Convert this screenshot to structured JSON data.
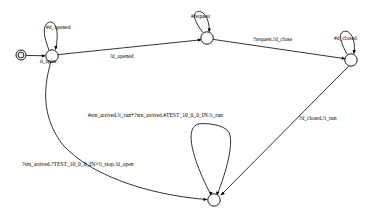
{
  "diagram": {
    "type": "state-machine",
    "title": "",
    "states": [
      {
        "id": "d_open",
        "label": "d_open",
        "cx": 52,
        "cy": 56,
        "r": 6.2,
        "initial": true
      },
      {
        "id": "s_req",
        "label": "",
        "cx": 207,
        "cy": 38,
        "r": 6.2,
        "initial": false
      },
      {
        "id": "d_closed",
        "label": "",
        "cx": 351,
        "cy": 60,
        "r": 6.2,
        "initial": false
      },
      {
        "id": "s_run",
        "label": "",
        "cx": 214,
        "cy": 200,
        "r": 6.2,
        "initial": false
      }
    ],
    "initial_marker": {
      "name": "initial-state-marker",
      "cx": 21,
      "cy": 55,
      "outer_r": 5.0,
      "inner_r": 3.0
    },
    "transitions": [
      {
        "id": "t-open-to-req",
        "from": "d_open",
        "to": "s_req",
        "label": "!d_opened",
        "label_x": 130,
        "label_y": 58
      },
      {
        "id": "t-req-to-closed",
        "from": "s_req",
        "to": "d_closed",
        "label": "?request.!d_close",
        "label_x": 258,
        "label_y": 41
      },
      {
        "id": "t-closed-to-run",
        "from": "d_closed",
        "to": "s_run",
        "label": "?d_closed.!t_run",
        "label_x": 302,
        "label_y": 119
      },
      {
        "id": "t-open-to-run",
        "from": "d_open",
        "to": "s_run",
        "label": "?stn_arrived.?TEST_10_0_0_IN>!t_stop.!d_open",
        "label_x": 22,
        "label_y": 166
      }
    ],
    "self_loops": [
      {
        "id": "loop-d-opened",
        "state": "d_open",
        "label": "#d_opened",
        "label_x": 46,
        "label_y": 29
      },
      {
        "id": "loop-request",
        "state": "s_req",
        "label": "#request",
        "label_x": 191,
        "label_y": 18
      },
      {
        "id": "loop-d-closed",
        "state": "d_closed",
        "label": "#d_closed",
        "label_x": 338,
        "label_y": 40
      },
      {
        "id": "loop-stn-arrived",
        "state": "s_run",
        "label": "#stn_arrived.!t_run+?stn_arrived.#TEST_10_0_0_IN.!t_run",
        "label_x": 88,
        "label_y": 117
      }
    ],
    "colors": {
      "stroke": "#000000",
      "fill": "#ffffff",
      "text": "#000000"
    }
  }
}
